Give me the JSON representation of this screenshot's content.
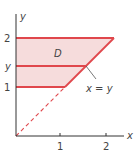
{
  "diagram": {
    "type": "region-of-integration",
    "region_label": "D",
    "axes": {
      "x_label": "x",
      "y_label": "y",
      "x_ticks": [
        "1",
        "2"
      ],
      "y_ticks": [
        "2",
        "y",
        "1"
      ]
    },
    "line_label": "x = y",
    "colors": {
      "region_fill": "#f6dcdc",
      "boundary": "#e0474c",
      "axis": "#333333",
      "text": "#444444"
    }
  }
}
